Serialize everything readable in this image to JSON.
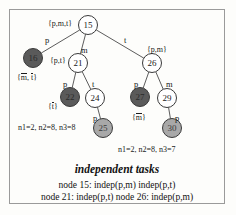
{
  "diagram": {
    "title": "independent tasks",
    "caption_line1": "node 15: indep(p,m) indep(p,t)",
    "caption_line2": "node 21: indep(p,t)   node 26: indep(p,m)",
    "annotation_left": "n1=2, n2=8, n3=8",
    "annotation_right": "n1=2, n2=8, n3=7",
    "nodes": [
      {
        "id": "15",
        "label": "15",
        "fill": "white",
        "cx": 88,
        "cy": 25,
        "r": 10
      },
      {
        "id": "16",
        "label": "16",
        "fill": "dark",
        "cx": 33,
        "cy": 58,
        "r": 10
      },
      {
        "id": "21",
        "label": "21",
        "fill": "white",
        "cx": 78,
        "cy": 63,
        "r": 10
      },
      {
        "id": "26",
        "label": "26",
        "fill": "white",
        "cx": 152,
        "cy": 63,
        "r": 10
      },
      {
        "id": "22",
        "label": "22",
        "fill": "dark",
        "cx": 70,
        "cy": 97,
        "r": 10
      },
      {
        "id": "24",
        "label": "24",
        "fill": "white",
        "cx": 95,
        "cy": 98,
        "r": 10
      },
      {
        "id": "27",
        "label": "27",
        "fill": "dark",
        "cx": 140,
        "cy": 97,
        "r": 10
      },
      {
        "id": "29",
        "label": "29",
        "fill": "white",
        "cx": 167,
        "cy": 98,
        "r": 10
      },
      {
        "id": "25",
        "label": "25",
        "fill": "mid",
        "cx": 103,
        "cy": 128,
        "r": 10
      },
      {
        "id": "30",
        "label": "30",
        "fill": "mid",
        "cx": 172,
        "cy": 128,
        "r": 10
      }
    ],
    "edges": [
      {
        "from": "15",
        "to": "16",
        "label": "p"
      },
      {
        "from": "15",
        "to": "21",
        "label": "m"
      },
      {
        "from": "15",
        "to": "26",
        "label": "t"
      },
      {
        "from": "21",
        "to": "22",
        "label": "p"
      },
      {
        "from": "21",
        "to": "24",
        "label": "t"
      },
      {
        "from": "26",
        "to": "27",
        "label": "p"
      },
      {
        "from": "26",
        "to": "29",
        "label": "m"
      },
      {
        "from": "24",
        "to": "25",
        "label": "p"
      },
      {
        "from": "29",
        "to": "30",
        "label": "p"
      }
    ],
    "set_labels": [
      {
        "id": "set-15",
        "text": "{p,m,t}",
        "x": 48,
        "y": 20
      },
      {
        "id": "set-21",
        "text": "{p,t}",
        "x": 50,
        "y": 57
      },
      {
        "id": "set-26",
        "text": "{p,m}",
        "x": 147,
        "y": 46
      }
    ],
    "overbar_labels": [
      {
        "id": "lbl-16",
        "parts": [
          "{",
          "m",
          ", ",
          "t",
          "}"
        ],
        "x": 17,
        "y": 73
      },
      {
        "id": "lbl-22",
        "parts": [
          "{",
          "t",
          "}"
        ],
        "x": 48,
        "y": 102
      },
      {
        "id": "lbl-27",
        "parts": [
          "{",
          "m",
          "}"
        ],
        "x": 132,
        "y": 113
      }
    ],
    "edge_label_positions": [
      {
        "id": "edge-lbl-15-16",
        "text": "p",
        "x": 45,
        "y": 36
      },
      {
        "id": "edge-lbl-15-21",
        "text": "m",
        "x": 81,
        "y": 46
      },
      {
        "id": "edge-lbl-15-26",
        "text": "t",
        "x": 124,
        "y": 36
      },
      {
        "id": "edge-lbl-21-22",
        "text": "p",
        "x": 63,
        "y": 80
      },
      {
        "id": "edge-lbl-21-24",
        "text": "t",
        "x": 92,
        "y": 80
      },
      {
        "id": "edge-lbl-26-27",
        "text": "p",
        "x": 134,
        "y": 80
      },
      {
        "id": "edge-lbl-26-29",
        "text": "m",
        "x": 166,
        "y": 80
      },
      {
        "id": "edge-lbl-24-25",
        "text": "p",
        "x": 93,
        "y": 114
      },
      {
        "id": "edge-lbl-29-30",
        "text": "p",
        "x": 175,
        "y": 114
      }
    ],
    "annotation_positions": {
      "left": {
        "x": 18,
        "y": 124
      },
      "right": {
        "x": 118,
        "y": 146
      }
    },
    "colors": {
      "fill_white": "#ffffff",
      "fill_dark": "#5a5a5a",
      "fill_mid": "#a8a8a8",
      "stroke": "#3a3a3a",
      "frame": "#9a9a9a",
      "background": "#fdfdfb",
      "text": "#1a1a1a"
    }
  }
}
